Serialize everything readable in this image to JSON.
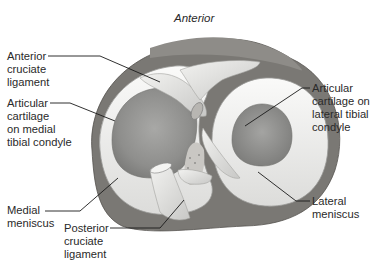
{
  "diagram": {
    "orientation_label": "Anterior",
    "labels": [
      {
        "id": "acl",
        "lines": [
          "Anterior",
          "cruciate",
          "ligament"
        ]
      },
      {
        "id": "medial_cartilage",
        "lines": [
          "Articular",
          "cartilage",
          "on medial",
          "tibial condyle"
        ]
      },
      {
        "id": "lateral_cartilage",
        "lines": [
          "Articular",
          "cartilage on",
          "lateral tibial",
          "condyle"
        ]
      },
      {
        "id": "medial_meniscus",
        "lines": [
          "Medial",
          "meniscus"
        ]
      },
      {
        "id": "pcl",
        "lines": [
          "Posterior",
          "cruciate",
          "ligament"
        ]
      },
      {
        "id": "lateral_meniscus",
        "lines": [
          "Lateral",
          "meniscus"
        ]
      }
    ],
    "colors": {
      "background": "#ffffff",
      "text": "#2a2a2a",
      "leader_line": "#1a1a1a",
      "meniscus": "#efefed",
      "cartilage": "#9a9a98",
      "bone": "#6e6c68",
      "ligament": "#e2e2e0"
    }
  }
}
